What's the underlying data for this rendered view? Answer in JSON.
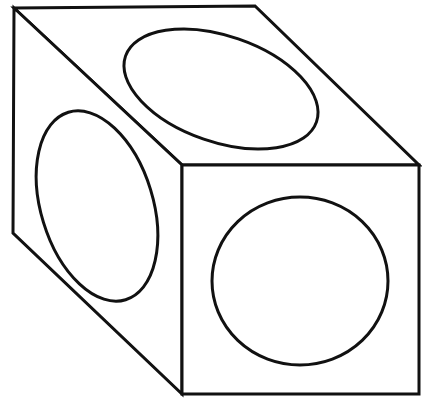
{
  "figure": {
    "stroke_color": "#111111",
    "background": "#ffffff",
    "stroke_width": 3
  },
  "cube": {
    "faces": [
      {
        "name": "top-face",
        "points": "14,8 255,6 419,165 182,165"
      },
      {
        "name": "left-face",
        "points": "14,8 182,165 182,394 13,233"
      },
      {
        "name": "front-face",
        "points": "182,165 419,165 419,394 182,394"
      }
    ]
  },
  "circles": [
    {
      "name": "top-face-ellipse",
      "cx": 221,
      "cy": 89,
      "rx": 101,
      "ry": 53,
      "rotate": 19
    },
    {
      "name": "left-face-ellipse",
      "cx": 97,
      "cy": 206,
      "rx": 56,
      "ry": 98,
      "rotate": -17
    },
    {
      "name": "front-face-circle",
      "cx": 300,
      "cy": 281,
      "rx": 88,
      "ry": 84,
      "rotate": 0
    }
  ]
}
